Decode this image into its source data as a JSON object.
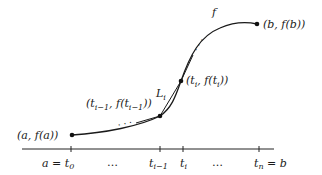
{
  "figure": {
    "curve_label": "f",
    "chord_label": "L",
    "chord_label_sub": "i",
    "points": [
      {
        "name": "start",
        "label": "(a, f(a))"
      },
      {
        "name": "t-i-minus-1",
        "label_pre": "(t",
        "label_sub": "i−1",
        "label_mid": ", f(t",
        "label_sub2": "i−1",
        "label_post": "))"
      },
      {
        "name": "t-i",
        "label_pre": "(t",
        "label_sub": "i",
        "label_mid": ", f(t",
        "label_sub2": "i",
        "label_post": "))"
      },
      {
        "name": "end",
        "label": "(b, f(b))"
      }
    ],
    "axis": {
      "ticks": [
        {
          "pre": "a = t",
          "sub": "0"
        },
        {
          "pre": "t",
          "sub": "i−1"
        },
        {
          "pre": "t",
          "sub": "i"
        },
        {
          "pre": "t",
          "sub": "n",
          "post": " = b"
        }
      ],
      "ellipses": [
        "…",
        "…"
      ]
    },
    "ellipsis_dots": "· · ·"
  }
}
